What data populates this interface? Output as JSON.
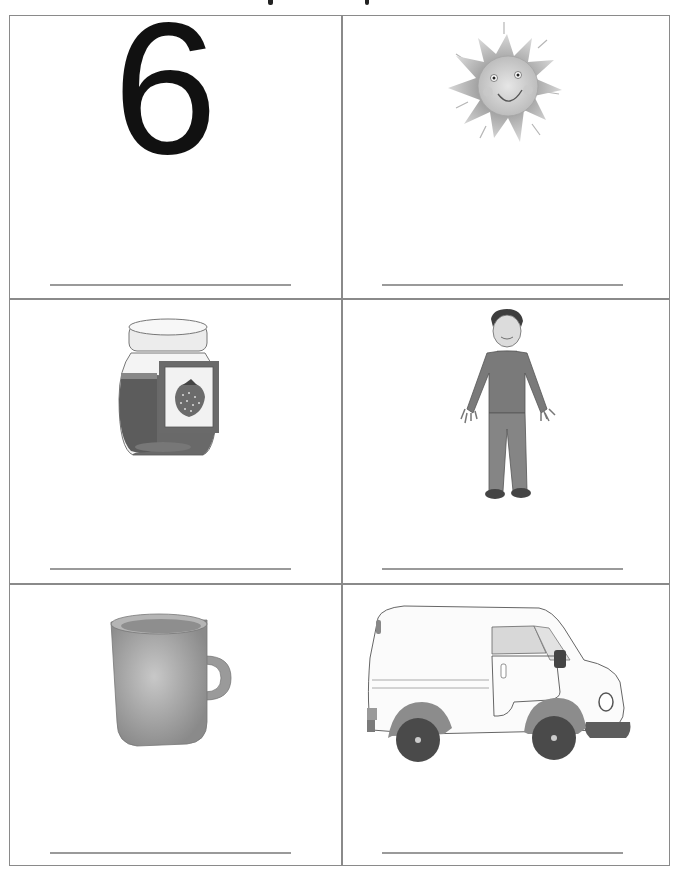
{
  "worksheet": {
    "header_clipped": true,
    "cells": [
      {
        "id": "number",
        "content_type": "numeral",
        "value": "6",
        "answer_line": ""
      },
      {
        "id": "sun",
        "content_type": "picture",
        "picture": "sun",
        "answer_line": ""
      },
      {
        "id": "jam",
        "content_type": "picture",
        "picture": "jam-jar",
        "answer_line": ""
      },
      {
        "id": "boy",
        "content_type": "picture",
        "picture": "boy",
        "answer_line": ""
      },
      {
        "id": "mug",
        "content_type": "picture",
        "picture": "mug",
        "answer_line": ""
      },
      {
        "id": "van",
        "content_type": "picture",
        "picture": "van",
        "answer_line": ""
      }
    ]
  },
  "colors": {
    "border": "#8a8a8a",
    "line": "#9a9a9a",
    "ink": "#111111",
    "illustration_dark": "#555555",
    "illustration_mid": "#8c8c8c",
    "illustration_light": "#c8c8c8"
  }
}
